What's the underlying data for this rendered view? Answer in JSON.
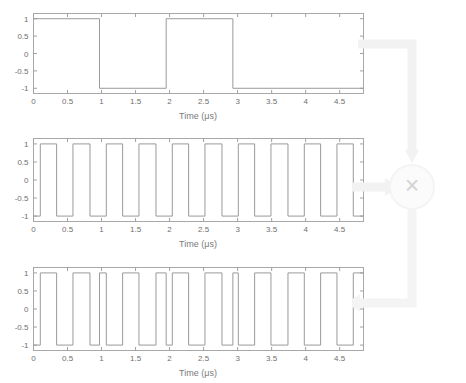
{
  "figure": {
    "title": "",
    "line_color": "#9a9a9a",
    "axis_color": "#a0a0a0",
    "text_color": "#6f6f6f",
    "background": "#ffffff",
    "overlay_color": "#f3f3f3",
    "overlay_symbol": "×",
    "overlay_symbol_color": "#d8d8d8"
  },
  "chart_data": [
    {
      "type": "line",
      "name": "data-signal",
      "title": "",
      "xlabel": "Time (μs)",
      "ylabel": "",
      "xlim": [
        0,
        4.85
      ],
      "ylim": [
        -1.15,
        1.15
      ],
      "xticks": [
        0,
        0.5,
        1,
        1.5,
        2,
        2.5,
        3,
        3.5,
        4,
        4.5
      ],
      "xticklabels": [
        "0",
        "0.5",
        "1",
        "1.5",
        "2",
        "2.5",
        "3",
        "3.5",
        "4",
        "4.5"
      ],
      "yticks": [
        -1,
        -0.5,
        0,
        0.5,
        1
      ],
      "yticklabels": [
        "-1",
        "-0.5",
        "0",
        "0.5",
        "1"
      ],
      "grid": false,
      "legend": "none",
      "transitions": [
        0.97,
        1.95,
        2.93
      ],
      "start_level": 1,
      "x": [
        0,
        0.97,
        0.97,
        1.95,
        1.95,
        2.93,
        2.93,
        4.85
      ],
      "y": [
        1,
        1,
        -1,
        -1,
        1,
        1,
        -1,
        -1
      ]
    },
    {
      "type": "line",
      "name": "chip-signal",
      "title": "",
      "xlabel": "Time (μs)",
      "ylabel": "",
      "xlim": [
        0,
        4.85
      ],
      "ylim": [
        -1.15,
        1.15
      ],
      "xticks": [
        0,
        0.5,
        1,
        1.5,
        2,
        2.5,
        3,
        3.5,
        4,
        4.5
      ],
      "xticklabels": [
        "0",
        "0.5",
        "1",
        "1.5",
        "2",
        "2.5",
        "3",
        "3.5",
        "4",
        "4.5"
      ],
      "yticks": [
        -1,
        -0.5,
        0,
        0.5,
        1
      ],
      "yticklabels": [
        "-1",
        "-0.5",
        "0",
        "0.5",
        "1"
      ],
      "grid": false,
      "legend": "none",
      "period": 0.485,
      "duty": 0.5,
      "phase_offset": 0.1,
      "start_level": -1,
      "x": [
        0,
        0.1,
        0.1,
        0.34,
        0.34,
        0.58,
        0.58,
        0.83,
        0.83,
        1.07,
        1.07,
        1.31,
        1.31,
        1.55,
        1.55,
        1.8,
        1.8,
        2.04,
        2.04,
        2.28,
        2.28,
        2.52,
        2.52,
        2.77,
        2.77,
        3.01,
        3.01,
        3.25,
        3.25,
        3.49,
        3.49,
        3.74,
        3.74,
        3.98,
        3.98,
        4.22,
        4.22,
        4.46,
        4.46,
        4.7,
        4.7,
        4.85
      ],
      "y": [
        -1,
        -1,
        1,
        1,
        -1,
        -1,
        1,
        1,
        -1,
        -1,
        1,
        1,
        -1,
        -1,
        1,
        1,
        -1,
        -1,
        1,
        1,
        -1,
        -1,
        1,
        1,
        -1,
        -1,
        1,
        1,
        -1,
        -1,
        1,
        1,
        -1,
        -1,
        1,
        1,
        -1,
        -1,
        1,
        1,
        -1,
        -1
      ]
    },
    {
      "type": "line",
      "name": "product-signal",
      "title": "",
      "xlabel": "Time (μs)",
      "ylabel": "",
      "xlim": [
        0,
        4.85
      ],
      "ylim": [
        -1.15,
        1.15
      ],
      "xticks": [
        0,
        0.5,
        1,
        1.5,
        2,
        2.5,
        3,
        3.5,
        4,
        4.5
      ],
      "xticklabels": [
        "0",
        "0.5",
        "1",
        "1.5",
        "2",
        "2.5",
        "3",
        "3.5",
        "4",
        "4.5"
      ],
      "yticks": [
        -1,
        -0.5,
        0,
        0.5,
        1
      ],
      "yticklabels": [
        "-1",
        "-0.5",
        "0",
        "0.5",
        "1"
      ],
      "grid": false,
      "legend": "none",
      "relation": "product of data-signal and chip-signal",
      "x": [
        0,
        0.1,
        0.1,
        0.34,
        0.34,
        0.58,
        0.58,
        0.83,
        0.83,
        0.97,
        0.97,
        1.07,
        1.07,
        1.31,
        1.31,
        1.55,
        1.55,
        1.8,
        1.8,
        1.95,
        1.95,
        2.04,
        2.04,
        2.28,
        2.28,
        2.52,
        2.52,
        2.77,
        2.77,
        2.93,
        2.93,
        3.01,
        3.01,
        3.25,
        3.25,
        3.49,
        3.49,
        3.74,
        3.74,
        3.98,
        3.98,
        4.22,
        4.22,
        4.46,
        4.46,
        4.7,
        4.7,
        4.85
      ],
      "y": [
        -1,
        -1,
        1,
        1,
        -1,
        -1,
        1,
        1,
        -1,
        -1,
        1,
        1,
        -1,
        -1,
        1,
        1,
        -1,
        -1,
        1,
        1,
        -1,
        -1,
        1,
        1,
        -1,
        -1,
        1,
        1,
        -1,
        -1,
        1,
        1,
        -1,
        -1,
        1,
        1,
        -1,
        -1,
        1,
        1,
        -1,
        -1,
        1,
        1,
        -1,
        -1,
        1,
        1
      ]
    }
  ],
  "axis_labels": {
    "plot1_x": "Time (μs)",
    "plot2_x": "Time (μs)",
    "plot3_x": "Time (μs)"
  },
  "overlay": {
    "multiply_symbol": "×",
    "flow": "data-signal and chip-signal feed a multiplier; output goes to product-signal"
  }
}
